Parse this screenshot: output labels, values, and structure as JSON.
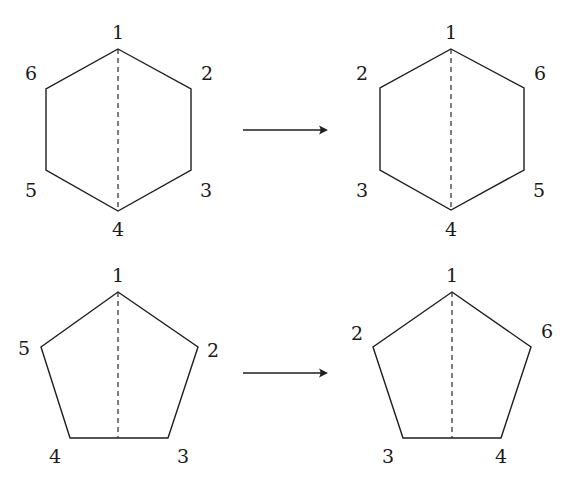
{
  "diagram": {
    "colors": {
      "stroke": "#1e1e1e",
      "background": "#ffffff",
      "label": "#1a1a1a"
    },
    "figures": [
      {
        "id": "hexagon-before",
        "shape": "hexagon",
        "vertices": [
          [
            118,
            49
          ],
          [
            191,
            89
          ],
          [
            191,
            170
          ],
          [
            118,
            211
          ],
          [
            46,
            170
          ],
          [
            46,
            89
          ]
        ],
        "axis": [
          [
            118,
            49
          ],
          [
            118,
            211
          ]
        ],
        "labels": [
          {
            "text": "1",
            "x": 118,
            "y": 32
          },
          {
            "text": "2",
            "x": 207,
            "y": 73
          },
          {
            "text": "3",
            "x": 206,
            "y": 190
          },
          {
            "text": "4",
            "x": 118,
            "y": 229
          },
          {
            "text": "5",
            "x": 31,
            "y": 190
          },
          {
            "text": "6",
            "x": 31,
            "y": 73
          }
        ]
      },
      {
        "id": "hexagon-after",
        "shape": "hexagon",
        "vertices": [
          [
            451,
            49
          ],
          [
            524,
            88
          ],
          [
            524,
            170
          ],
          [
            451,
            210
          ],
          [
            380,
            170
          ],
          [
            380,
            88
          ]
        ],
        "axis": [
          [
            451,
            49
          ],
          [
            451,
            210
          ]
        ],
        "labels": [
          {
            "text": "1",
            "x": 451,
            "y": 32
          },
          {
            "text": "6",
            "x": 540,
            "y": 73
          },
          {
            "text": "5",
            "x": 539,
            "y": 190
          },
          {
            "text": "4",
            "x": 451,
            "y": 229
          },
          {
            "text": "3",
            "x": 362,
            "y": 190
          },
          {
            "text": "2",
            "x": 362,
            "y": 73
          }
        ]
      },
      {
        "id": "pentagon-before",
        "shape": "pentagon",
        "vertices": [
          [
            118,
            292
          ],
          [
            198,
            347
          ],
          [
            168,
            438
          ],
          [
            70,
            438
          ],
          [
            41,
            347
          ]
        ],
        "axis": [
          [
            118,
            292
          ],
          [
            118,
            438
          ]
        ],
        "labels": [
          {
            "text": "1",
            "x": 118,
            "y": 275
          },
          {
            "text": "2",
            "x": 213,
            "y": 350
          },
          {
            "text": "3",
            "x": 183,
            "y": 456
          },
          {
            "text": "4",
            "x": 55,
            "y": 456
          },
          {
            "text": "5",
            "x": 24,
            "y": 348
          }
        ]
      },
      {
        "id": "pentagon-after",
        "shape": "pentagon",
        "vertices": [
          [
            452,
            292
          ],
          [
            531,
            347
          ],
          [
            501,
            438
          ],
          [
            403,
            438
          ],
          [
            373,
            347
          ]
        ],
        "axis": [
          [
            452,
            292
          ],
          [
            452,
            438
          ]
        ],
        "labels": [
          {
            "text": "1",
            "x": 452,
            "y": 275
          },
          {
            "text": "6",
            "x": 547,
            "y": 331
          },
          {
            "text": "4",
            "x": 501,
            "y": 456
          },
          {
            "text": "3",
            "x": 388,
            "y": 456
          },
          {
            "text": "2",
            "x": 357,
            "y": 333
          }
        ]
      }
    ],
    "arrows": [
      {
        "id": "arrow-hexagon",
        "from": [
          243,
          130
        ],
        "to": [
          328,
          130
        ]
      },
      {
        "id": "arrow-pentagon",
        "from": [
          243,
          373
        ],
        "to": [
          328,
          373
        ]
      }
    ]
  }
}
